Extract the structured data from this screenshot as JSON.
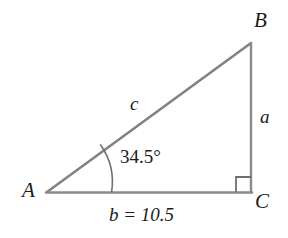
{
  "figure": {
    "type": "right-triangle-diagram",
    "background_color": "#ffffff",
    "stroke_color": "#808080",
    "text_color": "#1a1a1a",
    "vertices": {
      "a": {
        "label": "A",
        "x": 47,
        "y": 192
      },
      "b": {
        "label": "B",
        "x": 251,
        "y": 43
      },
      "c": {
        "label": "C",
        "x": 251,
        "y": 192
      }
    },
    "sides": {
      "opposite": {
        "label": "a",
        "from": "B",
        "to": "C"
      },
      "adjacent": {
        "label": "b",
        "value": "10.5",
        "equation": "b = 10.5",
        "from": "A",
        "to": "C"
      },
      "hypotenuse": {
        "label": "c",
        "from": "A",
        "to": "B"
      }
    },
    "angle": {
      "at": "A",
      "label": "34.5°",
      "value": 34.5,
      "unit": "degrees"
    },
    "right_angle": {
      "at": "C",
      "marker": "square",
      "size": 15
    }
  }
}
